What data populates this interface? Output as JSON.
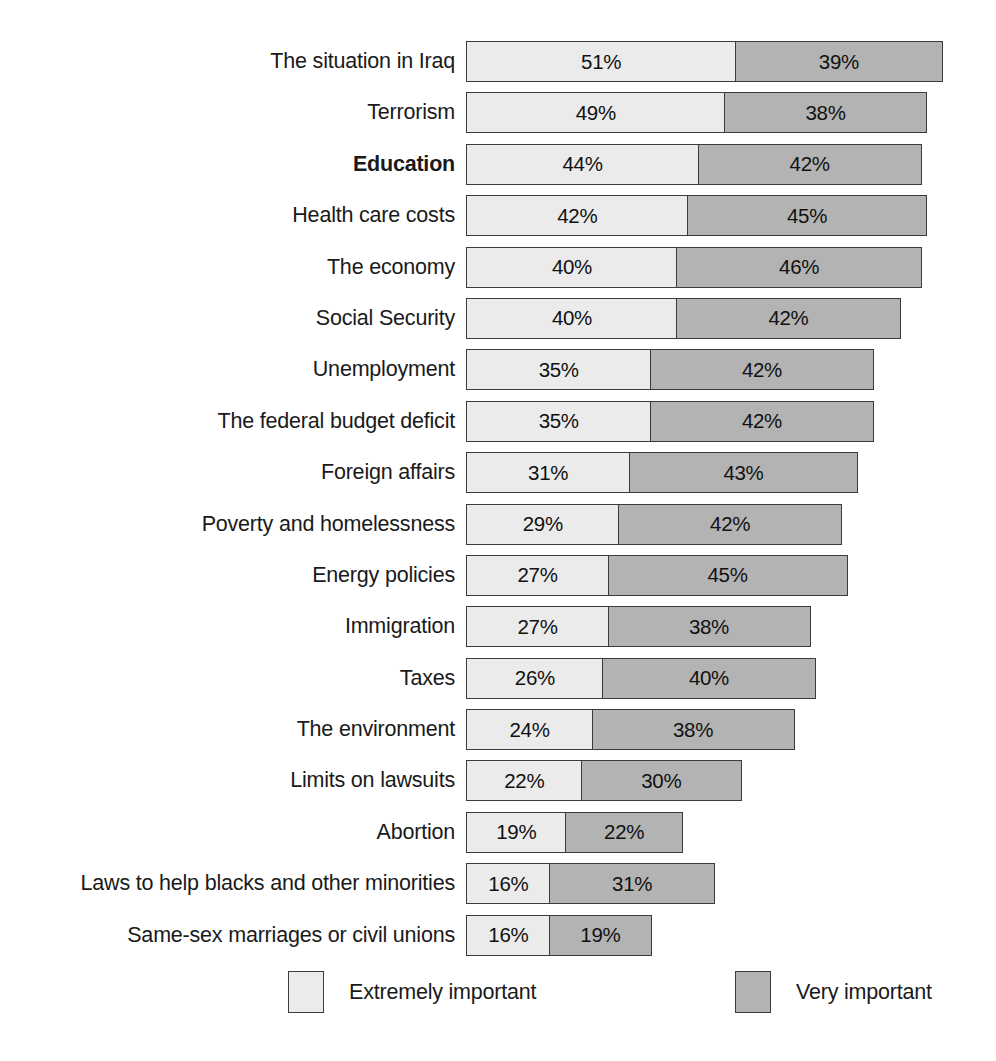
{
  "chart_data": {
    "type": "bar",
    "subtype": "horizontal-stacked-bar",
    "title": "",
    "subtitle": "",
    "xlabel": "",
    "ylabel": "",
    "xlim": [
      0,
      100
    ],
    "grid": false,
    "legend_position": "bottom",
    "value_suffix": "%",
    "categories": [
      "The situation in Iraq",
      "Terrorism",
      "Education",
      "Health care costs",
      "The economy",
      "Social Security",
      "Unemployment",
      "The federal budget deficit",
      "Foreign affairs",
      "Poverty and homelessness",
      "Energy policies",
      "Immigration",
      "Taxes",
      "The environment",
      "Limits on lawsuits",
      "Abortion",
      "Laws to help blacks and other minorities",
      "Same-sex marriages or civil unions"
    ],
    "emphasized_categories": [
      "Education"
    ],
    "series": [
      {
        "name": "Extremely important",
        "color": "#ebebeb",
        "values": [
          51,
          49,
          44,
          42,
          40,
          40,
          35,
          35,
          31,
          29,
          27,
          27,
          26,
          24,
          22,
          19,
          16,
          16
        ],
        "labels": [
          "51%",
          "49%",
          "44%",
          "42%",
          "40%",
          "40%",
          "35%",
          "35%",
          "31%",
          "29%",
          "27%",
          "27%",
          "26%",
          "24%",
          "22%",
          "19%",
          "16%",
          "16%"
        ]
      },
      {
        "name": "Very important",
        "color": "#b3b3b3",
        "values": [
          39,
          38,
          42,
          45,
          46,
          42,
          42,
          42,
          43,
          42,
          45,
          38,
          40,
          38,
          30,
          22,
          31,
          19
        ],
        "labels": [
          "39%",
          "38%",
          "42%",
          "45%",
          "46%",
          "42%",
          "42%",
          "42%",
          "43%",
          "42%",
          "45%",
          "38%",
          "40%",
          "38%",
          "30%",
          "22%",
          "31%",
          "19%"
        ]
      }
    ],
    "rows": [
      {
        "label": "The situation in Iraq",
        "emphasis": false,
        "primary": 51,
        "secondary": 39,
        "primary_label": "51%",
        "secondary_label": "39%"
      },
      {
        "label": "Terrorism",
        "emphasis": false,
        "primary": 49,
        "secondary": 38,
        "primary_label": "49%",
        "secondary_label": "38%"
      },
      {
        "label": "Education",
        "emphasis": true,
        "primary": 44,
        "secondary": 42,
        "primary_label": "44%",
        "secondary_label": "42%"
      },
      {
        "label": "Health care costs",
        "emphasis": false,
        "primary": 42,
        "secondary": 45,
        "primary_label": "42%",
        "secondary_label": "45%"
      },
      {
        "label": "The economy",
        "emphasis": false,
        "primary": 40,
        "secondary": 46,
        "primary_label": "40%",
        "secondary_label": "46%"
      },
      {
        "label": "Social Security",
        "emphasis": false,
        "primary": 40,
        "secondary": 42,
        "primary_label": "40%",
        "secondary_label": "42%"
      },
      {
        "label": "Unemployment",
        "emphasis": false,
        "primary": 35,
        "secondary": 42,
        "primary_label": "35%",
        "secondary_label": "42%"
      },
      {
        "label": "The federal budget deficit",
        "emphasis": false,
        "primary": 35,
        "secondary": 42,
        "primary_label": "35%",
        "secondary_label": "42%"
      },
      {
        "label": "Foreign affairs",
        "emphasis": false,
        "primary": 31,
        "secondary": 43,
        "primary_label": "31%",
        "secondary_label": "43%"
      },
      {
        "label": "Poverty and homelessness",
        "emphasis": false,
        "primary": 29,
        "secondary": 42,
        "primary_label": "29%",
        "secondary_label": "42%"
      },
      {
        "label": "Energy policies",
        "emphasis": false,
        "primary": 27,
        "secondary": 45,
        "primary_label": "27%",
        "secondary_label": "45%"
      },
      {
        "label": "Immigration",
        "emphasis": false,
        "primary": 27,
        "secondary": 38,
        "primary_label": "27%",
        "secondary_label": "38%"
      },
      {
        "label": "Taxes",
        "emphasis": false,
        "primary": 26,
        "secondary": 40,
        "primary_label": "26%",
        "secondary_label": "40%"
      },
      {
        "label": "The environment",
        "emphasis": false,
        "primary": 24,
        "secondary": 38,
        "primary_label": "24%",
        "secondary_label": "38%"
      },
      {
        "label": "Limits on lawsuits",
        "emphasis": false,
        "primary": 22,
        "secondary": 30,
        "primary_label": "22%",
        "secondary_label": "30%"
      },
      {
        "label": "Abortion",
        "emphasis": false,
        "primary": 19,
        "secondary": 22,
        "primary_label": "19%",
        "secondary_label": "22%"
      },
      {
        "label": "Laws to help blacks and other minorities",
        "emphasis": false,
        "primary": 16,
        "secondary": 31,
        "primary_label": "16%",
        "secondary_label": "31%"
      },
      {
        "label": "Same-sex marriages or civil unions",
        "emphasis": false,
        "primary": 16,
        "secondary": 19,
        "primary_label": "16%",
        "secondary_label": "19%"
      }
    ],
    "legend": [
      {
        "label": "Extremely important",
        "color": "#ebebeb"
      },
      {
        "label": "Very important",
        "color": "#b3b3b3"
      }
    ]
  }
}
